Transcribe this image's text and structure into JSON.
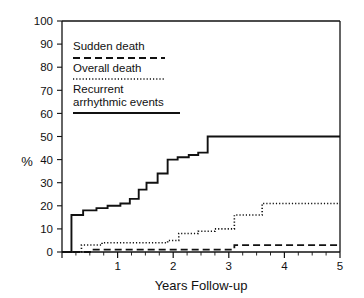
{
  "chart_data": {
    "type": "line",
    "title": "",
    "subtitle": "",
    "xlabel": "Years Follow-up",
    "ylabel": "%",
    "xlim": [
      0,
      5
    ],
    "ylim": [
      0,
      100
    ],
    "grid": false,
    "legend_position": "upper-left-inside",
    "x_ticks": [
      0,
      1,
      2,
      3,
      4,
      5
    ],
    "x_tick_labels": [
      "0",
      "1",
      "2",
      "3",
      "4",
      "5"
    ],
    "x_minor_tick_interval": 0.25,
    "y_ticks": [
      0,
      10,
      20,
      30,
      40,
      50,
      60,
      70,
      80,
      90,
      100
    ],
    "y_tick_labels": [
      "0",
      "10",
      "20",
      "30",
      "40",
      "50",
      "60",
      "70",
      "80",
      "90",
      "100"
    ],
    "curve_style": "step-post",
    "series": [
      {
        "name": "Sudden death",
        "line_style": "dashed",
        "color": "#111111",
        "x": [
          0,
          0.55,
          3.1,
          5
        ],
        "values": [
          0,
          1,
          3,
          3
        ]
      },
      {
        "name": "Overall death",
        "line_style": "dotted",
        "color": "#111111",
        "x": [
          0,
          0.35,
          0.72,
          1.9,
          2.1,
          2.45,
          2.75,
          3.1,
          3.6,
          5
        ],
        "values": [
          0,
          3,
          4,
          5,
          8,
          9,
          10,
          16,
          21,
          21
        ]
      },
      {
        "name": "Recurrent arrhythmic events",
        "line_style": "solid",
        "color": "#111111",
        "x": [
          0,
          0.17,
          0.38,
          0.62,
          0.82,
          1.05,
          1.22,
          1.38,
          1.52,
          1.72,
          1.9,
          2.08,
          2.28,
          2.45,
          2.62,
          5
        ],
        "values": [
          0,
          16,
          18,
          19,
          20,
          21,
          23,
          27,
          30,
          34,
          40,
          41,
          42,
          43,
          50,
          50
        ]
      }
    ]
  },
  "legend": {
    "entries": [
      {
        "label": "Sudden death",
        "style": "dashed"
      },
      {
        "label": "Overall death",
        "style": "dotted"
      },
      {
        "label_line1": "Recurrent",
        "label_line2": "arrhythmic events",
        "style": "solid"
      }
    ]
  },
  "axes": {
    "y_axis_label": "%",
    "x_axis_label": "Years Follow-up"
  },
  "colors": {
    "ink": "#111111",
    "background": "#ffffff"
  }
}
